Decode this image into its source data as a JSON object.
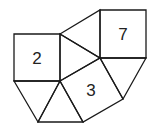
{
  "diagram": {
    "type": "polygon-tiling",
    "squares": [
      {
        "label": "2",
        "points": "14,34 60,34 60,81 14,81",
        "label_pos": [
          37,
          58
        ]
      },
      {
        "label": "7",
        "points": "100,10 146,10 146,58 100,58",
        "label_pos": [
          123,
          34
        ]
      },
      {
        "label": "3",
        "points": "60,81 100,58 123,99 83,122",
        "label_pos": [
          91,
          90
        ]
      }
    ],
    "triangles": [
      {
        "points": "60,34 100,10 100,58"
      },
      {
        "points": "60,34 100,58 60,81"
      },
      {
        "points": "100,58 146,58 123,99"
      },
      {
        "points": "14,81 60,81 38,122"
      },
      {
        "points": "60,81 83,122 38,122"
      }
    ]
  }
}
